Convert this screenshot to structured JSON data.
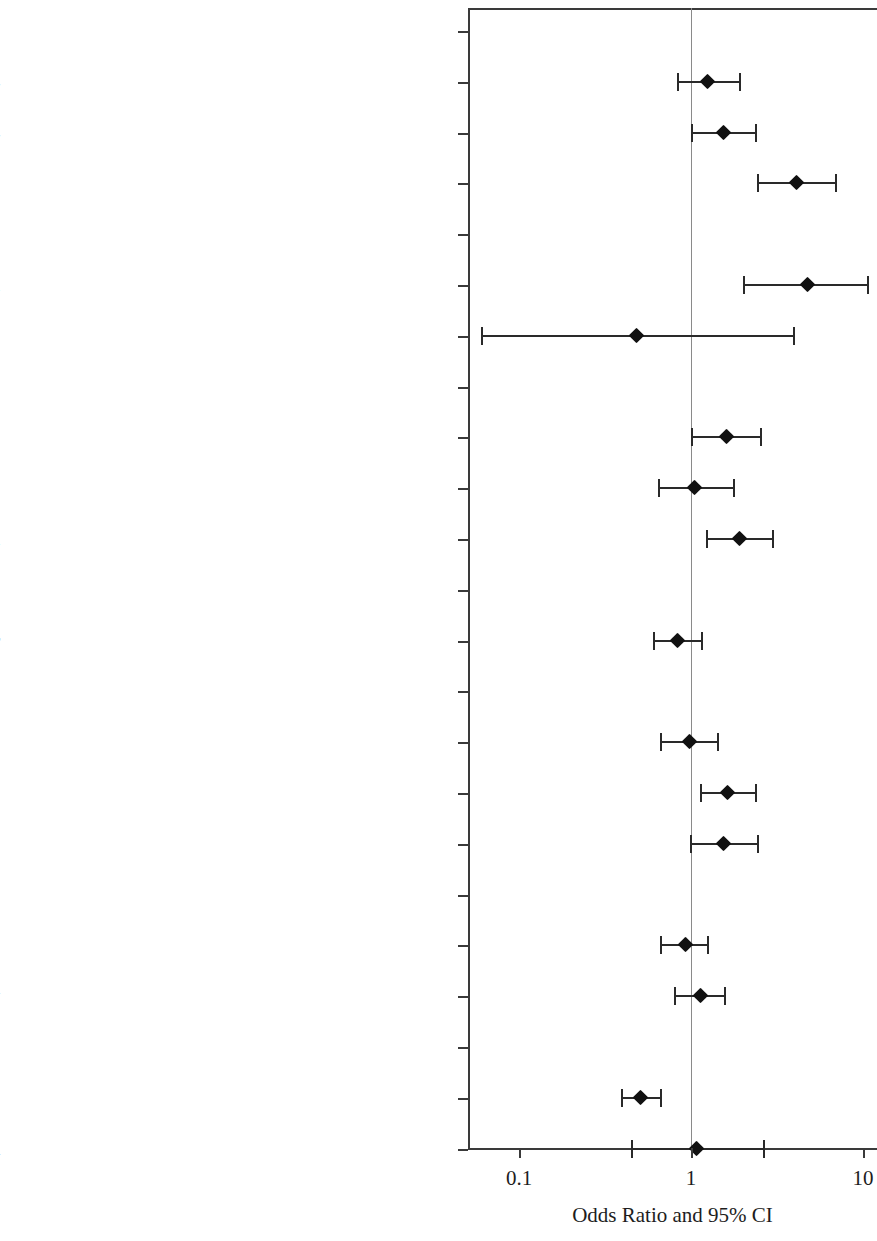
{
  "chart_data": {
    "type": "scatter",
    "subtype": "forest-plot",
    "title": "",
    "xlabel": "Odds Ratio and 95% CI",
    "ylabel": "",
    "xscale": "log",
    "xlim": [
      0.06,
      13
    ],
    "xticks": [
      0.1,
      1,
      10
    ],
    "xtick_labels": [
      "0.1",
      "1",
      "10"
    ],
    "reference_line": 1,
    "grid": false,
    "legend": null,
    "rows": [
      {
        "label": "Age Group: 40-54 (Reference)",
        "or": null,
        "lo": null,
        "hi": null,
        "reference": true
      },
      {
        "label": "55-64",
        "or": 1.25,
        "lo": 0.83,
        "hi": 1.9,
        "reference": false
      },
      {
        "label": "65-74",
        "or": 1.54,
        "lo": 1.0,
        "hi": 2.36,
        "reference": false
      },
      {
        "label": "75+",
        "or": 4.11,
        "lo": 2.41,
        "hi": 6.87,
        "reference": false
      },
      {
        "label": "Race: White (Reference)",
        "or": null,
        "lo": null,
        "hi": null,
        "reference": true
      },
      {
        "label": "Black or African American",
        "or": 4.75,
        "lo": 2.0,
        "hi": 10.5,
        "reference": false
      },
      {
        "label": "Other Race",
        "or": 0.48,
        "lo": 0.06,
        "hi": 3.9,
        "reference": false
      },
      {
        "label": "Marital Status: Married (Reference)",
        "or": null,
        "lo": null,
        "hi": null,
        "reference": true
      },
      {
        "label": "Single",
        "or": 1.6,
        "lo": 1.0,
        "hi": 2.52,
        "reference": false
      },
      {
        "label": "Widow",
        "or": 1.05,
        "lo": 0.64,
        "hi": 1.75,
        "reference": false
      },
      {
        "label": "Divorced or Separated",
        "or": 1.91,
        "lo": 1.22,
        "hi": 2.96,
        "reference": false
      },
      {
        "label": "Insurance Status: Medicare/VA/Medicaid (Reference)",
        "or": null,
        "lo": null,
        "hi": null,
        "reference": true
      },
      {
        "label": "Commercial or Other",
        "or": 0.84,
        "lo": 0.6,
        "hi": 1.15,
        "reference": false
      },
      {
        "label": "CCI: 0 (Reference)",
        "or": null,
        "lo": null,
        "hi": null,
        "reference": true
      },
      {
        "label": "1",
        "or": 0.98,
        "lo": 0.66,
        "hi": 1.41,
        "reference": false
      },
      {
        "label": "2+",
        "or": 1.63,
        "lo": 1.13,
        "hi": 2.36,
        "reference": false
      },
      {
        "label": "Comorbid Condition: COPD",
        "or": 1.54,
        "lo": 0.99,
        "hi": 2.43,
        "reference": false
      },
      {
        "label": "Family History of Prostate Cancer: No (Reference)",
        "or": null,
        "lo": null,
        "hi": null,
        "reference": true
      },
      {
        "label": "Yes",
        "or": 0.93,
        "lo": 0.66,
        "hi": 1.24,
        "reference": false
      },
      {
        "label": "Unknown Family History",
        "or": 1.13,
        "lo": 0.8,
        "hi": 1.56,
        "reference": false
      },
      {
        "label": "Risk Category: Low (Reference)",
        "or": null,
        "lo": null,
        "hi": null,
        "reference": true
      },
      {
        "label": "Intermediate",
        "or": 0.51,
        "lo": 0.39,
        "hi": 0.66,
        "reference": false
      },
      {
        "label": "Unknown Risk",
        "or": 1.07,
        "lo": 0.45,
        "hi": 2.61,
        "reference": false
      }
    ]
  },
  "colors": {
    "marker": "#111111",
    "interval": "#2a2a2a",
    "axis": "#3a3a3a",
    "reference_line": "#8a8a8a",
    "text": "#1d1d1d",
    "background": "#ffffff"
  }
}
